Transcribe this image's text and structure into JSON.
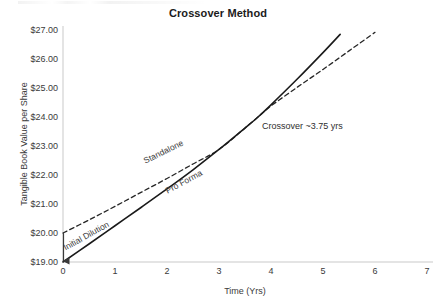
{
  "chart_data": {
    "type": "line",
    "title": "Crossover Method",
    "xlabel": "Time (Yrs)",
    "ylabel": "Tangible Book Value per Share",
    "xlim": [
      0,
      7
    ],
    "ylim": [
      19,
      27
    ],
    "xticks": [
      "0",
      "1",
      "2",
      "3",
      "4",
      "5",
      "6",
      "7"
    ],
    "xtick_values": [
      0,
      1,
      2,
      3,
      4,
      5,
      6,
      7
    ],
    "yticks": [
      "$19.00",
      "$20.00",
      "$21.00",
      "$22.00",
      "$23.00",
      "$24.00",
      "$25.00",
      "$26.00",
      "$27.00"
    ],
    "ytick_values": [
      19,
      20,
      21,
      22,
      23,
      24,
      25,
      26,
      27
    ],
    "grid": false,
    "legend": "inline-labels",
    "series": [
      {
        "name": "Standalone",
        "style": "dashed",
        "color": "#262626",
        "x": [
          0,
          0.5,
          1,
          1.5,
          2,
          2.5,
          3,
          3.5,
          3.75,
          4,
          4.5,
          5,
          5.5,
          6
        ],
        "y": [
          20.0,
          20.45,
          20.92,
          21.4,
          21.88,
          22.38,
          22.88,
          23.62,
          24.0,
          24.38,
          25.02,
          25.64,
          26.28,
          26.92
        ]
      },
      {
        "name": "Pro Forma",
        "style": "solid",
        "color": "#1a1a1a",
        "x": [
          0,
          0.5,
          1,
          1.5,
          2,
          2.5,
          3,
          3.5,
          3.75,
          4,
          4.5,
          5,
          5.33
        ],
        "y": [
          19.0,
          19.62,
          20.25,
          20.88,
          21.52,
          22.18,
          22.88,
          23.62,
          24.0,
          24.42,
          25.3,
          26.22,
          26.85
        ]
      }
    ],
    "annotations": [
      {
        "name": "crossover-label",
        "text": "Crossover ~3.75 yrs",
        "x": 3.83,
        "y": 24.05
      },
      {
        "name": "initial-dilution-label",
        "text": "Initial Dilution",
        "x": 0.05,
        "y": 19.65
      },
      {
        "name": "standalone-label",
        "text": "Standalone",
        "x": 1.55,
        "y": 22.65
      },
      {
        "name": "proforma-label",
        "text": "Pro Forma",
        "x": 1.98,
        "y": 21.65
      }
    ],
    "arrow": {
      "name": "initial-dilution-arrow",
      "from": {
        "x": 0.0,
        "y": 20.0
      },
      "to": {
        "x": 0.0,
        "y": 19.0
      }
    }
  }
}
